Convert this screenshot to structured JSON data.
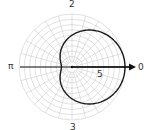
{
  "chart_data": {
    "type": "line",
    "subtype": "polar",
    "title": "",
    "equation_estimate": "r = 6 + 4cos(theta)",
    "angle_labels": {
      "right": "0",
      "top": "2",
      "left": "π",
      "bottom": "3"
    },
    "radial_tick_label": "5",
    "radial_range": [
      0,
      10
    ],
    "grid": true,
    "radial_gridlines": 10,
    "angular_gridlines": 24,
    "series": [
      {
        "name": "curve",
        "theta_deg": [
          0,
          30,
          60,
          90,
          120,
          150,
          180,
          210,
          240,
          270,
          300,
          330,
          360
        ],
        "r": [
          10,
          9.46,
          8,
          6,
          4,
          2.54,
          2,
          2.54,
          4,
          6,
          8,
          9.46,
          10
        ]
      }
    ],
    "colors": {
      "curve": "#1a1a1a",
      "grid": "#cccccc",
      "axis": "#111111",
      "label": "#333333"
    }
  }
}
